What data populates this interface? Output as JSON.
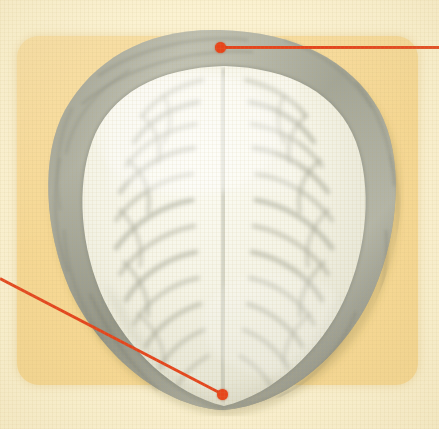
{
  "figure": {
    "kind": "anatomical-illustration",
    "view_label": "superior view",
    "canvas": {
      "width": 439,
      "height": 429
    }
  },
  "palette": {
    "page_background": "#fbf2d2",
    "panel_background": "#f6d894",
    "leader_line": "#e4451d",
    "marker_dot": "#e8441a",
    "bone_rim_dark": "#7e8074",
    "bone_rim_mid": "#9b9d8f",
    "bone_rim_light": "#c9cabc",
    "brain_surface": "#f4f3e6",
    "sulcus_shadow": "#a9aa9b"
  },
  "panel": {
    "name": "content-panel",
    "x": 17,
    "y": 36,
    "width": 401,
    "height": 349,
    "corner_radius": 22
  },
  "specimen": {
    "name": "specimen-brain-superior-view",
    "x": 38,
    "y": 24,
    "width": 366,
    "height": 392,
    "outline_top_y": 28,
    "outline_bottom_y": 412,
    "outline_left_x": 40,
    "outline_right_x": 402
  },
  "annotations": [
    {
      "id": "annotation-top",
      "dot": {
        "x": 220,
        "y": 47
      },
      "line": {
        "x1": 220,
        "y1": 47,
        "x2": 439,
        "y2": 47
      },
      "direction": "right",
      "label": ""
    },
    {
      "id": "annotation-bottom-left",
      "dot": {
        "x": 222,
        "y": 394
      },
      "line": {
        "x1": 0,
        "y1": 277,
        "x2": 222,
        "y2": 394
      },
      "direction": "left",
      "label": ""
    }
  ]
}
